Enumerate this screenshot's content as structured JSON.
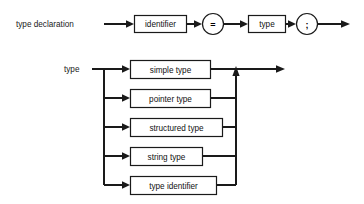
{
  "diagram": {
    "background_color": "#ffffff",
    "line_color": "#1a1a1a",
    "box_fill_color": "#ffffff",
    "text_color": "#111111",
    "productions": [
      {
        "id": "type-declaration",
        "name": "type declaration",
        "label": "type declaration",
        "elements": [
          {
            "kind": "nonterminal",
            "label": "identifier"
          },
          {
            "kind": "terminal",
            "label": "="
          },
          {
            "kind": "nonterminal",
            "label": "type"
          },
          {
            "kind": "terminal",
            "label": ";"
          }
        ]
      },
      {
        "id": "type",
        "name": "type",
        "label": "type",
        "alternatives": [
          {
            "kind": "nonterminal",
            "label": "simple type"
          },
          {
            "kind": "nonterminal",
            "label": "pointer type"
          },
          {
            "kind": "nonterminal",
            "label": "structured type"
          },
          {
            "kind": "nonterminal",
            "label": "string type"
          },
          {
            "kind": "nonterminal",
            "label": "type identifier"
          }
        ]
      }
    ]
  }
}
